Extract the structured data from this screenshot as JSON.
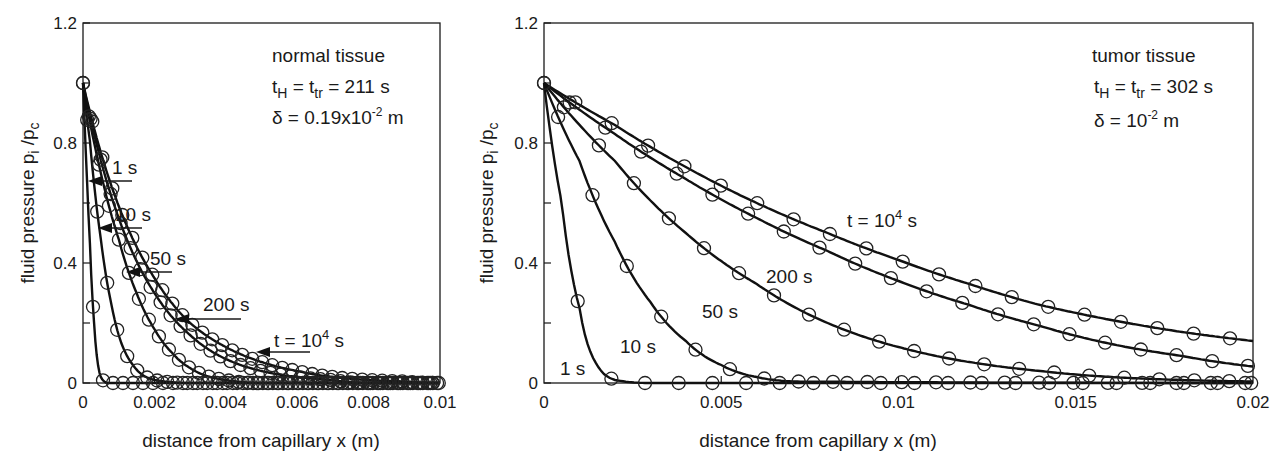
{
  "chart_data": [
    {
      "type": "line",
      "panel": "left",
      "annotation": {
        "line1": "normal  tissue",
        "line2_prefix": "t",
        "line2_sub1": "H",
        "line2_mid": " = t",
        "line2_sub2": "tr",
        "line2_suffix": " = 211 s",
        "line3_prefix": "δ = 0.19x10",
        "line3_sup": "-2",
        "line3_suffix": " m"
      },
      "xlabel": "distance from capillary  x (m)",
      "ylabel_prefix": "fluid pressure p",
      "ylabel_sub1": "i",
      "ylabel_mid": " /p",
      "ylabel_sub2": "c",
      "xlim": [
        0,
        0.01
      ],
      "ylim": [
        0,
        1.2
      ],
      "xticks": [
        "0",
        "0.002",
        "0.004",
        "0.006",
        "0.008",
        "0.01"
      ],
      "yticks": [
        "0",
        "0.4",
        "0.8",
        "1.2"
      ],
      "grid": false,
      "markers": "open circles (numerical) on solid lines (analytical)",
      "series": [
        {
          "name": "1 s",
          "label": "1 s",
          "x": [
            0,
            0.0001,
            0.0002,
            0.0003,
            0.0004,
            0.0005,
            0.0007,
            0.001
          ],
          "values": [
            1.0,
            0.72,
            0.45,
            0.22,
            0.08,
            0.02,
            0.0,
            0.0
          ]
        },
        {
          "name": "10 s",
          "label": "10 s",
          "x": [
            0,
            0.0002,
            0.0005,
            0.0008,
            0.001,
            0.0014,
            0.002,
            0.003
          ],
          "values": [
            1.0,
            0.8,
            0.48,
            0.26,
            0.16,
            0.06,
            0.01,
            0.0
          ]
        },
        {
          "name": "50 s",
          "label": "50 s",
          "x": [
            0,
            0.0005,
            0.001,
            0.0015,
            0.002,
            0.0025,
            0.003,
            0.004,
            0.005
          ],
          "values": [
            1.0,
            0.7,
            0.48,
            0.3,
            0.18,
            0.1,
            0.05,
            0.01,
            0.0
          ]
        },
        {
          "name": "200 s",
          "label": "200 s",
          "x": [
            0,
            0.001,
            0.002,
            0.003,
            0.004,
            0.005,
            0.006,
            0.007,
            0.008
          ],
          "values": [
            1.0,
            0.55,
            0.3,
            0.16,
            0.08,
            0.04,
            0.02,
            0.01,
            0.0
          ]
        },
        {
          "name": "t = 10^4 s",
          "label": "t = 10⁴ s",
          "x": [
            0,
            0.001,
            0.002,
            0.003,
            0.004,
            0.005,
            0.006,
            0.007,
            0.008,
            0.009,
            0.01
          ],
          "values": [
            1.0,
            0.59,
            0.35,
            0.2,
            0.12,
            0.07,
            0.04,
            0.02,
            0.01,
            0.005,
            0.0
          ]
        }
      ]
    },
    {
      "type": "line",
      "panel": "right",
      "annotation": {
        "line1": "tumor  tissue",
        "line2_prefix": "t",
        "line2_sub1": "H",
        "line2_mid": " = t",
        "line2_sub2": "tr",
        "line2_suffix": " = 302 s",
        "line3_prefix": "δ = 10",
        "line3_sup": "-2",
        "line3_suffix": " m"
      },
      "xlabel": "distance from capillary x (m)",
      "ylabel_prefix": "fluid pressure p",
      "ylabel_sub1": "i",
      "ylabel_mid": " /p",
      "ylabel_sub2": "c",
      "xlim": [
        0,
        0.02
      ],
      "ylim": [
        0,
        1.2
      ],
      "xticks": [
        "0",
        "0.005",
        "0.01",
        "0.015",
        "0.02"
      ],
      "yticks": [
        "0",
        "0.4",
        "0.8",
        "1.2"
      ],
      "grid": false,
      "markers": "open circles (numerical) on solid lines (analytical)",
      "series": [
        {
          "name": "1 s",
          "label": "1 s",
          "x": [
            0,
            0.0005,
            0.001,
            0.0015,
            0.002,
            0.003,
            0.02
          ],
          "values": [
            1.0,
            0.6,
            0.25,
            0.06,
            0.01,
            0.0,
            0.0
          ]
        },
        {
          "name": "10 s",
          "label": "10 s",
          "x": [
            0,
            0.001,
            0.002,
            0.003,
            0.004,
            0.005,
            0.006,
            0.007,
            0.02
          ],
          "values": [
            1.0,
            0.74,
            0.47,
            0.27,
            0.14,
            0.06,
            0.02,
            0.005,
            0.0
          ]
        },
        {
          "name": "50 s",
          "label": "50 s",
          "x": [
            0,
            0.002,
            0.004,
            0.006,
            0.008,
            0.01,
            0.012,
            0.014,
            0.016,
            0.018,
            0.02
          ],
          "values": [
            1.0,
            0.74,
            0.5,
            0.33,
            0.2,
            0.12,
            0.07,
            0.04,
            0.02,
            0.01,
            0.005
          ]
        },
        {
          "name": "200 s",
          "label": "200 s",
          "x": [
            0,
            0.002,
            0.004,
            0.006,
            0.008,
            0.01,
            0.012,
            0.014,
            0.016,
            0.018,
            0.02
          ],
          "values": [
            1.0,
            0.83,
            0.68,
            0.55,
            0.44,
            0.34,
            0.26,
            0.19,
            0.13,
            0.09,
            0.055
          ]
        },
        {
          "name": "t = 10^4 s",
          "label": "t = 10⁴ s",
          "x": [
            0,
            0.002,
            0.004,
            0.006,
            0.008,
            0.01,
            0.012,
            0.014,
            0.016,
            0.018,
            0.02
          ],
          "values": [
            1.0,
            0.86,
            0.72,
            0.6,
            0.5,
            0.41,
            0.33,
            0.26,
            0.21,
            0.17,
            0.14
          ]
        }
      ]
    }
  ]
}
